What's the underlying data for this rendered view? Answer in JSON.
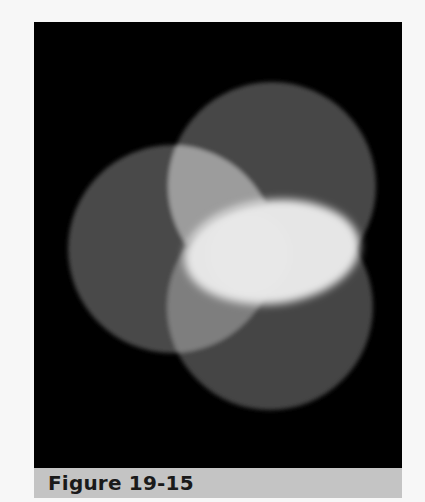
{
  "figure": {
    "caption": "Figure 19-15",
    "colors": {
      "page_background": "#f7f7f7",
      "photo_background": "#000000",
      "caption_bar": "#c4c4c4",
      "caption_text": "#1a1a1a",
      "single_overlap": "#4a4a4a",
      "double_overlap": "#9a9a9a",
      "triple_overlap": "#e8e8e8"
    }
  }
}
